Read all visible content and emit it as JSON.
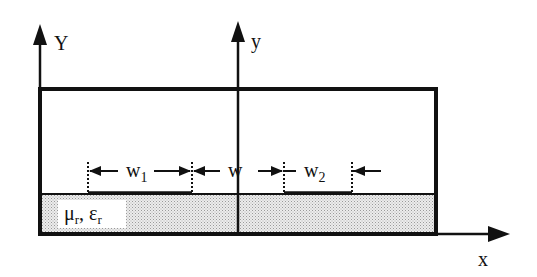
{
  "diagram": {
    "type": "coupled microstrip cross-section",
    "colors": {
      "line": "#111111",
      "substrate_fill": "#d9d9d9",
      "background": "#ffffff"
    },
    "axes": {
      "Y_label": "Y",
      "y_label": "y",
      "x_label": "x"
    },
    "dimensions": {
      "w1_base": "w",
      "w1_sub": "1",
      "w_label": "w",
      "w2_base": "w",
      "w2_sub": "2"
    },
    "substrate": {
      "mu": "μ",
      "mu_sub": "r",
      "sep": ", ",
      "eps": "ε",
      "eps_sub": "r"
    }
  }
}
